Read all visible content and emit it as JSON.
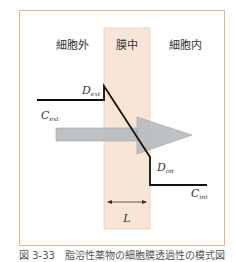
{
  "diagram": {
    "regions": {
      "extracellular": "細胞外",
      "membrane": "膜中",
      "intracellular": "細胞内"
    },
    "labels": {
      "d_ext_main": "D",
      "d_ext_sub": "ext",
      "c_ext_main": "C",
      "c_ext_sub": "ext",
      "d_int_main": "D",
      "d_int_sub": "int",
      "c_int_main": "C",
      "c_int_sub": "int",
      "thickness": "L"
    },
    "colors": {
      "frame": "#f0b089",
      "membrane_fill": "#f7e6d8",
      "membrane_edge": "#d9c2ad",
      "arrow_fill": "#b4b8bb",
      "line": "#111111"
    }
  },
  "caption": "図 3-33　脂溶性薬物の細胞膜透過性の模式図"
}
